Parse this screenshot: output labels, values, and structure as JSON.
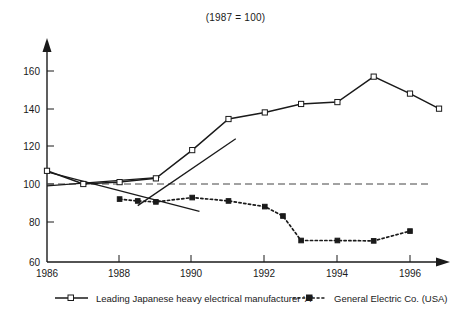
{
  "chart_data": {
    "type": "line",
    "title": "(1987 = 100)",
    "xlabel": "",
    "ylabel": "",
    "xlim": [
      1986,
      1996.8
    ],
    "ylim": [
      60,
      170
    ],
    "yticks": [
      60,
      80,
      100,
      120,
      140,
      160
    ],
    "xticks": [
      1986,
      1988,
      1990,
      1992,
      1994,
      1996
    ],
    "xtick_labels": [
      "1986",
      "1988",
      "1990",
      "1992",
      "1994",
      "1996"
    ],
    "ytick_labels": [
      "60",
      "80",
      "100",
      "120",
      "140",
      "160"
    ],
    "grid": false,
    "legend_position": "bottom",
    "reference_line": {
      "value": 100,
      "style": "dashed",
      "label": ""
    },
    "series": [
      {
        "name": "Leading Japanese heavy electrical manufacturer 'A'",
        "marker": "open-square",
        "line_style": "solid",
        "color": "#1a1a1a",
        "x": [
          1986,
          1987,
          1988,
          1989,
          1990,
          1991,
          1992,
          1993,
          1994,
          1995,
          1996,
          1996.8
        ],
        "values": [
          107,
          100,
          101,
          103,
          118,
          134.5,
          138,
          142.5,
          143.5,
          157,
          148,
          140
        ]
      },
      {
        "name": "General Electric Co. (USA)",
        "marker": "filled-square",
        "line_style": "dotted",
        "color": "#1a1a1a",
        "x": [
          1988,
          1988.5,
          1989,
          1990,
          1991,
          1992,
          1992.5,
          1993,
          1994,
          1995,
          1996
        ],
        "values": [
          92,
          91,
          90.5,
          92.8,
          91,
          88,
          83,
          70,
          70,
          69.8,
          75
        ]
      }
    ],
    "trend_lines": [
      {
        "name": "japanese-trend-line",
        "x": [
          1986,
          1989.1
        ],
        "values": [
          99,
          103.5
        ]
      },
      {
        "name": "ge-trend-line",
        "x": [
          1986,
          1990.2
        ],
        "values": [
          106.5,
          85.5
        ]
      },
      {
        "name": "ge-rise-segment",
        "x": [
          1988.5,
          1991.2
        ],
        "values": [
          88.5,
          124
        ]
      }
    ],
    "legend": [
      {
        "label": "Leading Japanese heavy electrical manufacturer 'A'",
        "marker": "open-square",
        "line_style": "solid"
      },
      {
        "label": "General Electric Co. (USA)",
        "marker": "filled-square",
        "line_style": "dotted"
      }
    ]
  }
}
